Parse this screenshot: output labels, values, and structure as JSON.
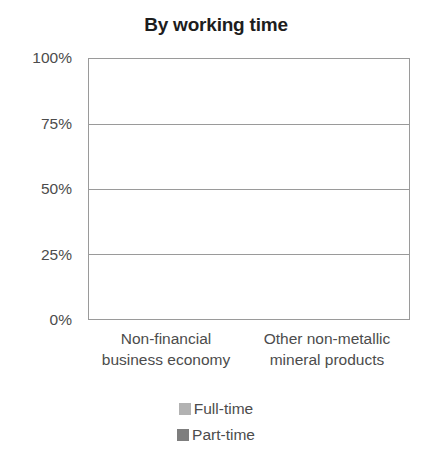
{
  "chart_data": {
    "type": "bar",
    "subtype": "stacked-percentage",
    "title": "By working time",
    "xlabel": "",
    "ylabel": "",
    "categories": [
      "Non-financial business economy",
      "Other non-metallic mineral products"
    ],
    "category_lines": [
      [
        "Non-financial",
        "business economy"
      ],
      [
        "Other non-metallic",
        "mineral products"
      ]
    ],
    "series": [
      {
        "name": "Full-time",
        "values": [
          85,
          94
        ],
        "color": "#b2b2b2"
      },
      {
        "name": "Part-time",
        "values": [
          15,
          6
        ],
        "color": "#7e7e7e"
      }
    ],
    "stack_order_bottom_to_top": [
      "Part-time",
      "Full-time"
    ],
    "ylim": [
      0,
      100
    ],
    "yticks": [
      0,
      25,
      50,
      75,
      100
    ],
    "ytick_labels": [
      "0%",
      "25%",
      "50%",
      "75%",
      "100%"
    ],
    "grid": true,
    "grid_axis": "y",
    "legend_position": "bottom-center",
    "legend": [
      {
        "label": "Full-time",
        "color": "#b2b2b2"
      },
      {
        "label": "Part-time",
        "color": "#7e7e7e"
      }
    ],
    "units": "percent"
  },
  "axis": {
    "y_labels": [
      "100%",
      "75%",
      "50%",
      "25%",
      "0%"
    ]
  },
  "colors": {
    "full_time": "#b2b2b2",
    "part_time": "#7e7e7e",
    "axis_line": "#9a9a9a",
    "text": "#4c4c4c",
    "title_text": "#1d1d1d",
    "background": "#ffffff"
  }
}
